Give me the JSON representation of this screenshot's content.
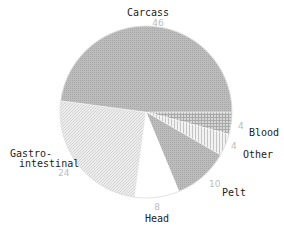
{
  "chart_data": {
    "type": "pie",
    "title": "",
    "categories": [
      "Carcass",
      "Blood",
      "Other",
      "Pelt",
      "Head",
      "Gastro-intestinal"
    ],
    "values": [
      46,
      4,
      4,
      10,
      8,
      24
    ],
    "slices": [
      {
        "label": "Carcass",
        "value": 46,
        "display_value": "46",
        "fill": "#b4b4b4",
        "pattern": "dense-dots"
      },
      {
        "label": "Blood",
        "value": 4,
        "display_value": "4",
        "fill": "#c8c8c8",
        "pattern": "crosshatch"
      },
      {
        "label": "Other",
        "value": 4,
        "display_value": "4",
        "fill": "#e6e6e6",
        "pattern": "vertical-lines"
      },
      {
        "label": "Pelt",
        "value": 10,
        "display_value": "10",
        "fill": "#b8b8b8",
        "pattern": "dense-dots"
      },
      {
        "label": "Head",
        "value": 8,
        "display_value": "8",
        "fill": "#ffffff",
        "pattern": "none"
      },
      {
        "label": "Gastro-intestinal",
        "label_lines": [
          "Gastro-",
          "intestinal"
        ],
        "value": 24,
        "display_value": "24",
        "fill": "#e4e4e4",
        "pattern": "diagonal-hatch"
      }
    ],
    "start_angle_deg": 0,
    "direction": "clockwise-from-3-oclock for small slices; Carcass occupies top half",
    "legend": "none (direct labels)"
  },
  "labels": {
    "carcass": {
      "name": "Carcass",
      "value": "46"
    },
    "blood": {
      "name": "Blood",
      "value": "4"
    },
    "other": {
      "name": "Other",
      "value": "4"
    },
    "pelt": {
      "name": "Pelt",
      "value": "10"
    },
    "head": {
      "name": "Head",
      "value": "8"
    },
    "gastro": {
      "name_line1": "Gastro-",
      "name_line2": "intestinal",
      "value": "24"
    }
  }
}
